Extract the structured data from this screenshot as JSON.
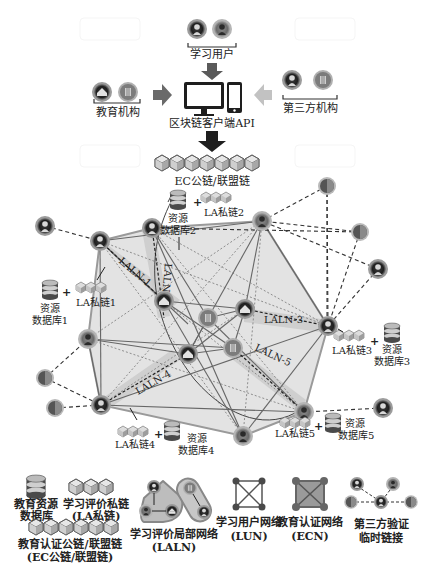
{
  "diagram": {
    "top": {
      "learning_users_label": "学习用户",
      "edu_institution_label": "教育机构",
      "third_party_label": "第三方机构",
      "client_api_label": "区块链客户端API",
      "ec_chain_label": "EC公链/联盟链"
    },
    "resources": [
      {
        "id": 1,
        "db_label_line1": "资源",
        "db_label_line2": "数据库1",
        "chain_label": "LA私链1"
      },
      {
        "id": 2,
        "db_label_line1": "资源",
        "db_label_line2": "数据库2",
        "chain_label": "LA私链2"
      },
      {
        "id": 3,
        "db_label_line1": "资源",
        "db_label_line2": "数据库3",
        "chain_label": "LA私链3"
      },
      {
        "id": 4,
        "db_label_line1": "资源",
        "db_label_line2": "数据库4",
        "chain_label": "LA私链4"
      },
      {
        "id": 5,
        "db_label_line1": "资源",
        "db_label_line2": "数据库5",
        "chain_label": "LA私链5"
      }
    ],
    "plus_sign": "+",
    "laln_labels": [
      "LALN-1",
      "LALN-2",
      "LALN-3",
      "LALN-4",
      "LALN-5"
    ],
    "legend": {
      "edu_db_line1": "教育资源",
      "edu_db_line2": "数据库",
      "la_chain_line1": "学习评价私链",
      "la_chain_line2": "(LA私链)",
      "ec_chain_line1": "教育认证公链/联盟链",
      "ec_chain_line2": "(EC公链/联盟链)",
      "laln_line1": "学习评价局部网络",
      "laln_line2": "(LALN)",
      "lun_line1": "学习用户网络",
      "lun_line2": "(LUN)",
      "ecn_line1": "教育认证网络",
      "ecn_line2": "(ECN)",
      "third_line1": "第三方验证",
      "third_line2": "临时链接"
    },
    "colors": {
      "node_ring": "#9a9a9a",
      "node_dark": "#2a2a2a",
      "node_mid": "#6e6e6e",
      "network_fill": "#d9d9d9",
      "band_fill": "#c4c4c4",
      "arrow_dark": "#2b2b2b",
      "arrow_mid": "#777777",
      "arrow_light": "#bdbdbd",
      "line": "#555555"
    }
  }
}
